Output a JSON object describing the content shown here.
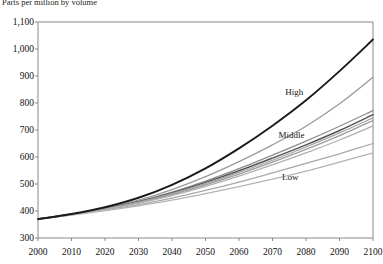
{
  "chart_data": {
    "type": "line",
    "title": "Parts per million by volume",
    "xlabel": "",
    "ylabel": "",
    "xlim": [
      2000,
      2100
    ],
    "ylim": [
      300,
      1100
    ],
    "grid": false,
    "legend_position": "inline-annotations",
    "x": [
      2000,
      2010,
      2020,
      2030,
      2040,
      2050,
      2060,
      2070,
      2080,
      2090,
      2100
    ],
    "x_tick_labels": [
      "2000",
      "2010",
      "2020",
      "2030",
      "2040",
      "2050",
      "2060",
      "2070",
      "2080",
      "2090",
      "2100"
    ],
    "y_tick_values": [
      300,
      400,
      500,
      600,
      700,
      800,
      900,
      1000,
      1100
    ],
    "y_tick_labels": [
      "300",
      "400",
      "500",
      "600",
      "700",
      "800",
      "900",
      "1,000",
      "1,100"
    ],
    "annotations": [
      {
        "text": "High",
        "x": 2078,
        "y": 840
      },
      {
        "text": "Middle",
        "x": 2076,
        "y": 680
      },
      {
        "text": "Low",
        "x": 2077,
        "y": 525
      }
    ],
    "series": [
      {
        "name": "High",
        "color": "#1a1a1a",
        "width": 1.9,
        "values": [
          370,
          389,
          414,
          449,
          497,
          558,
          632,
          716,
          810,
          918,
          1035
        ]
      },
      {
        "name": "Scenario A1",
        "color": "#9a9a9a",
        "width": 1.3,
        "values": [
          370,
          388,
          410,
          440,
          479,
          527,
          583,
          645,
          714,
          797,
          895
        ]
      },
      {
        "name": "Scenario A2",
        "color": "#8e8e8e",
        "width": 1.3,
        "values": [
          370,
          388,
          409,
          436,
          470,
          511,
          557,
          607,
          659,
          714,
          772
        ]
      },
      {
        "name": "Scenario B1",
        "color": "#555555",
        "width": 1.5,
        "values": [
          370,
          388,
          408,
          434,
          467,
          506,
          549,
          596,
          645,
          698,
          757
        ]
      },
      {
        "name": "Scenario B2",
        "color": "#a2a2a2",
        "width": 1.3,
        "values": [
          370,
          388,
          408,
          433,
          464,
          501,
          543,
          588,
          637,
          689,
          745
        ]
      },
      {
        "name": "Scenario C1",
        "color": "#9d9d9d",
        "width": 1.3,
        "values": [
          370,
          387,
          407,
          431,
          461,
          497,
          537,
          581,
          628,
          679,
          735
        ]
      },
      {
        "name": "Scenario C2",
        "color": "#b0b0b0",
        "width": 1.3,
        "values": [
          370,
          387,
          406,
          429,
          457,
          491,
          529,
          571,
          615,
          663,
          715
        ]
      },
      {
        "name": "Scenario D1",
        "color": "#a8a8a8",
        "width": 1.3,
        "values": [
          370,
          386,
          404,
          424,
          448,
          476,
          507,
          541,
          576,
          612,
          650
        ]
      },
      {
        "name": "Low",
        "color": "#b4b4b4",
        "width": 1.3,
        "values": [
          370,
          385,
          401,
          419,
          440,
          464,
          490,
          518,
          548,
          581,
          615
        ]
      }
    ],
    "axis_frame": {
      "left_px": 38,
      "right_px": 373,
      "top_px": 22,
      "bottom_px": 238,
      "frame_color": "#7a7a7a"
    }
  }
}
